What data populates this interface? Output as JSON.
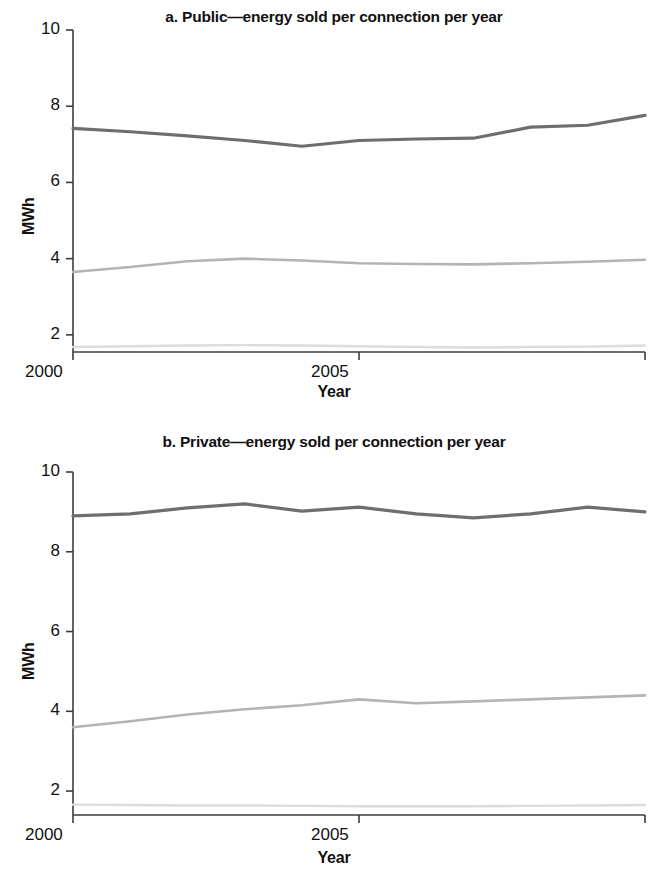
{
  "figure": {
    "background": "#ffffff",
    "axis_color": "#3c3c3c"
  },
  "chart_data": [
    {
      "type": "line",
      "panel_id": "a",
      "title": "a. Public—energy sold per connection per year",
      "xlabel": "Year",
      "ylabel": "MWh",
      "xlim": [
        1995,
        2005
      ],
      "ylim": [
        1.0,
        10.0
      ],
      "yticks": [
        2,
        4,
        6,
        8,
        10
      ],
      "ytick_labels": [
        "2",
        "4",
        "6",
        "8",
        "10"
      ],
      "xticks": [
        1995,
        2000,
        2005
      ],
      "xtick_labels": [
        "1995",
        "2000",
        "2005"
      ],
      "grid": false,
      "legend": "none",
      "x": [
        1995,
        1996,
        1997,
        1998,
        1999,
        2000,
        2001,
        2002,
        2003,
        2004,
        2005
      ],
      "series": [
        {
          "name": "top",
          "color": "#6e6e6e",
          "width": 3.2,
          "values": [
            7.42,
            7.33,
            7.22,
            7.1,
            6.95,
            7.1,
            7.14,
            7.16,
            7.45,
            7.5,
            7.76
          ]
        },
        {
          "name": "middle",
          "color": "#b4b4b4",
          "width": 2.6,
          "values": [
            3.65,
            3.78,
            3.93,
            4.0,
            3.95,
            3.88,
            3.86,
            3.85,
            3.88,
            3.92,
            3.97
          ]
        },
        {
          "name": "bottom",
          "color": "#dcdcdc",
          "width": 2.4,
          "values": [
            1.68,
            1.7,
            1.72,
            1.73,
            1.72,
            1.7,
            1.68,
            1.67,
            1.68,
            1.69,
            1.72
          ]
        }
      ]
    },
    {
      "type": "line",
      "panel_id": "b",
      "title": "b. Private—energy sold per connection per year",
      "xlabel": "Year",
      "ylabel": "MWh",
      "xlim": [
        1995,
        2005
      ],
      "ylim": [
        1.0,
        10.0
      ],
      "yticks": [
        2,
        4,
        6,
        8,
        10
      ],
      "ytick_labels": [
        "2",
        "4",
        "6",
        "8",
        "10"
      ],
      "xticks": [
        1995,
        2000,
        2005
      ],
      "xtick_labels": [
        "1995",
        "2000",
        "2005"
      ],
      "grid": false,
      "legend": "none",
      "x": [
        1995,
        1996,
        1997,
        1998,
        1999,
        2000,
        2001,
        2002,
        2003,
        2004,
        2005
      ],
      "series": [
        {
          "name": "top",
          "color": "#6e6e6e",
          "width": 3.2,
          "values": [
            8.9,
            8.95,
            9.1,
            9.2,
            9.02,
            9.12,
            8.95,
            8.85,
            8.95,
            9.12,
            9.0
          ]
        },
        {
          "name": "middle",
          "color": "#b4b4b4",
          "width": 2.6,
          "values": [
            3.6,
            3.75,
            3.92,
            4.05,
            4.15,
            4.3,
            4.2,
            4.25,
            4.3,
            4.35,
            4.4
          ]
        },
        {
          "name": "bottom",
          "color": "#dcdcdc",
          "width": 2.4,
          "values": [
            1.66,
            1.65,
            1.64,
            1.64,
            1.63,
            1.62,
            1.62,
            1.62,
            1.63,
            1.64,
            1.65
          ]
        }
      ]
    }
  ],
  "panels": {
    "a": {
      "title": "a. Public—energy sold per connection per year",
      "ylabel": "MWh",
      "xlabel": "Year",
      "ytick_labels": [
        "10",
        "8",
        "6",
        "4",
        "2"
      ],
      "xtick_labels": [
        "1995",
        "2000",
        "2005"
      ]
    },
    "b": {
      "title": "b. Private—energy sold per connection per year",
      "ylabel": "MWh",
      "xlabel": "Year",
      "ytick_labels": [
        "10",
        "8",
        "6",
        "4",
        "2"
      ],
      "xtick_labels": [
        "1995",
        "2000",
        "2005"
      ]
    }
  }
}
